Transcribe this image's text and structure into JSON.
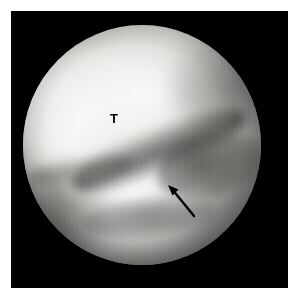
{
  "image": {
    "kind": "arthroscopic-photograph",
    "modality": "Arthroscopy / endoscopic still frame",
    "background_color": "#ffffff",
    "frame_color": "#000000",
    "field_shape": "circle",
    "width": 288,
    "height": 299
  },
  "annotations": {
    "labels": [
      {
        "id": "tibia",
        "text": "T",
        "meaning": "T",
        "x": 103,
        "y": 108,
        "color": "#000000"
      },
      {
        "id": "disc",
        "text": "D",
        "meaning": "D",
        "x": 122,
        "y": 262,
        "color": "#000000"
      }
    ],
    "arrow": {
      "id": "pointer-arrow",
      "color": "#000000",
      "tip_x": 168,
      "tip_y": 185,
      "tail_x": 194,
      "tail_y": 216,
      "direction": "up-left"
    }
  },
  "field": {
    "center_x": 138,
    "center_y": 150,
    "radius_x": 119,
    "radius_y": 120,
    "highlight_color": "#ffffff",
    "midtone_color": "#c9c9c6",
    "shadow_color": "#2c2c2a",
    "vignette_color": "#000000"
  }
}
